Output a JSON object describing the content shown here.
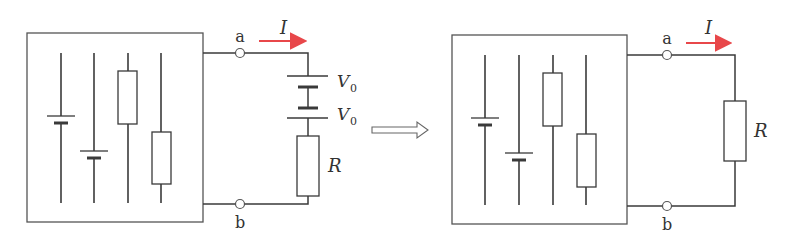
{
  "diagram": {
    "colors": {
      "wire": "#3a3a3a",
      "box": "#555555",
      "current_arrow": "#e8474a",
      "label": "#333333"
    },
    "left_circuit": {
      "terminal_a": "a",
      "terminal_b": "b",
      "current_label": "I",
      "source_1_label": "V",
      "source_1_sub": "0",
      "source_2_label": "V",
      "source_2_sub": "0",
      "resistor_label": "R"
    },
    "transform_arrow": "equivalent-transform-arrow",
    "right_circuit": {
      "terminal_a": "a",
      "terminal_b": "b",
      "current_label": "I",
      "resistor_label": "R"
    }
  }
}
